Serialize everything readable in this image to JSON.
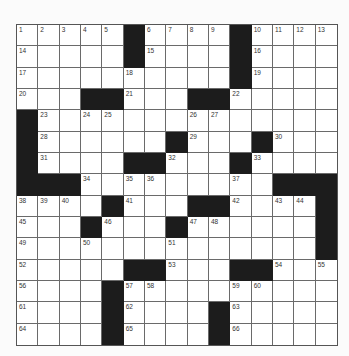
{
  "puzzle": {
    "rows": 15,
    "cols": 15,
    "colors": {
      "black": "#1c1c1c",
      "white": "#ffffff",
      "line": "#6a6a6a",
      "number": "#333333"
    },
    "black_cells": [
      [
        0,
        5
      ],
      [
        0,
        10
      ],
      [
        1,
        5
      ],
      [
        1,
        10
      ],
      [
        2,
        10
      ],
      [
        3,
        3
      ],
      [
        3,
        4
      ],
      [
        3,
        8
      ],
      [
        3,
        9
      ],
      [
        4,
        0
      ],
      [
        5,
        0
      ],
      [
        5,
        7
      ],
      [
        5,
        11
      ],
      [
        6,
        0
      ],
      [
        6,
        5
      ],
      [
        6,
        6
      ],
      [
        6,
        10
      ],
      [
        7,
        0
      ],
      [
        7,
        1
      ],
      [
        7,
        2
      ],
      [
        7,
        12
      ],
      [
        7,
        13
      ],
      [
        7,
        14
      ],
      [
        8,
        4
      ],
      [
        8,
        8
      ],
      [
        8,
        9
      ],
      [
        8,
        14
      ],
      [
        9,
        3
      ],
      [
        9,
        7
      ],
      [
        9,
        14
      ],
      [
        10,
        14
      ],
      [
        11,
        5
      ],
      [
        11,
        6
      ],
      [
        11,
        10
      ],
      [
        11,
        11
      ],
      [
        12,
        4
      ],
      [
        13,
        4
      ],
      [
        13,
        9
      ],
      [
        14,
        4
      ],
      [
        14,
        9
      ]
    ],
    "numbers": [
      {
        "r": 0,
        "c": 0,
        "n": "1"
      },
      {
        "r": 0,
        "c": 1,
        "n": "2"
      },
      {
        "r": 0,
        "c": 2,
        "n": "3"
      },
      {
        "r": 0,
        "c": 3,
        "n": "4"
      },
      {
        "r": 0,
        "c": 4,
        "n": "5"
      },
      {
        "r": 0,
        "c": 6,
        "n": "6"
      },
      {
        "r": 0,
        "c": 7,
        "n": "7"
      },
      {
        "r": 0,
        "c": 8,
        "n": "8"
      },
      {
        "r": 0,
        "c": 9,
        "n": "9"
      },
      {
        "r": 0,
        "c": 11,
        "n": "10"
      },
      {
        "r": 0,
        "c": 12,
        "n": "11"
      },
      {
        "r": 0,
        "c": 13,
        "n": "12"
      },
      {
        "r": 0,
        "c": 14,
        "n": "13"
      },
      {
        "r": 1,
        "c": 0,
        "n": "14"
      },
      {
        "r": 1,
        "c": 6,
        "n": "15"
      },
      {
        "r": 1,
        "c": 11,
        "n": "16"
      },
      {
        "r": 2,
        "c": 0,
        "n": "17"
      },
      {
        "r": 2,
        "c": 5,
        "n": "18"
      },
      {
        "r": 2,
        "c": 11,
        "n": "19"
      },
      {
        "r": 3,
        "c": 0,
        "n": "20"
      },
      {
        "r": 3,
        "c": 5,
        "n": "21"
      },
      {
        "r": 3,
        "c": 10,
        "n": "22"
      },
      {
        "r": 4,
        "c": 1,
        "n": "23"
      },
      {
        "r": 4,
        "c": 3,
        "n": "24"
      },
      {
        "r": 4,
        "c": 4,
        "n": "25"
      },
      {
        "r": 4,
        "c": 8,
        "n": "26"
      },
      {
        "r": 4,
        "c": 9,
        "n": "27"
      },
      {
        "r": 5,
        "c": 1,
        "n": "28"
      },
      {
        "r": 5,
        "c": 8,
        "n": "29"
      },
      {
        "r": 5,
        "c": 12,
        "n": "30"
      },
      {
        "r": 6,
        "c": 1,
        "n": "31"
      },
      {
        "r": 6,
        "c": 7,
        "n": "32"
      },
      {
        "r": 6,
        "c": 11,
        "n": "33"
      },
      {
        "r": 7,
        "c": 3,
        "n": "34"
      },
      {
        "r": 7,
        "c": 5,
        "n": "35"
      },
      {
        "r": 7,
        "c": 6,
        "n": "36"
      },
      {
        "r": 7,
        "c": 10,
        "n": "37"
      },
      {
        "r": 8,
        "c": 0,
        "n": "38"
      },
      {
        "r": 8,
        "c": 1,
        "n": "39"
      },
      {
        "r": 8,
        "c": 2,
        "n": "40"
      },
      {
        "r": 8,
        "c": 5,
        "n": "41"
      },
      {
        "r": 8,
        "c": 10,
        "n": "42"
      },
      {
        "r": 8,
        "c": 12,
        "n": "43"
      },
      {
        "r": 8,
        "c": 13,
        "n": "44"
      },
      {
        "r": 9,
        "c": 0,
        "n": "45"
      },
      {
        "r": 9,
        "c": 4,
        "n": "46"
      },
      {
        "r": 9,
        "c": 8,
        "n": "47"
      },
      {
        "r": 9,
        "c": 9,
        "n": "48"
      },
      {
        "r": 10,
        "c": 0,
        "n": "49"
      },
      {
        "r": 10,
        "c": 3,
        "n": "50"
      },
      {
        "r": 10,
        "c": 7,
        "n": "51"
      },
      {
        "r": 11,
        "c": 0,
        "n": "52"
      },
      {
        "r": 11,
        "c": 7,
        "n": "53"
      },
      {
        "r": 11,
        "c": 12,
        "n": "54"
      },
      {
        "r": 11,
        "c": 14,
        "n": "55"
      },
      {
        "r": 12,
        "c": 0,
        "n": "56"
      },
      {
        "r": 12,
        "c": 5,
        "n": "57"
      },
      {
        "r": 12,
        "c": 6,
        "n": "58"
      },
      {
        "r": 12,
        "c": 10,
        "n": "59"
      },
      {
        "r": 12,
        "c": 11,
        "n": "60"
      },
      {
        "r": 13,
        "c": 0,
        "n": "61"
      },
      {
        "r": 13,
        "c": 5,
        "n": "62"
      },
      {
        "r": 13,
        "c": 10,
        "n": "63"
      },
      {
        "r": 14,
        "c": 0,
        "n": "64"
      },
      {
        "r": 14,
        "c": 5,
        "n": "65"
      },
      {
        "r": 14,
        "c": 10,
        "n": "66"
      }
    ]
  }
}
